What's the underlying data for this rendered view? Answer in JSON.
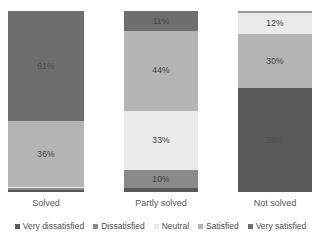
{
  "chart_data": {
    "type": "bar",
    "variant": "stacked-100-percent",
    "orientation": "vertical",
    "title": "",
    "subtitle": "",
    "xlabel": "",
    "ylabel": "",
    "ylim": [
      0,
      100
    ],
    "grid": false,
    "axis_visible": false,
    "value_labels": true,
    "value_label_suffix": "%",
    "legend_position": "bottom",
    "categories": [
      "Solved",
      "Partly solved",
      "Not solved"
    ],
    "series": [
      {
        "name": "Very dissatisfied",
        "color": "#595959",
        "values": [
          1,
          2,
          58
        ],
        "labels": [
          "",
          "",
          "58%"
        ]
      },
      {
        "name": "Dissatisfied",
        "color": "#7b7b7b",
        "values": [
          1,
          10,
          0
        ],
        "labels": [
          "",
          "10%",
          ""
        ]
      },
      {
        "name": "Neutral",
        "color": "#eaeaea",
        "values": [
          1,
          33,
          12
        ],
        "labels": [
          "",
          "33%",
          "12%"
        ]
      },
      {
        "name": "Satisfied",
        "color": "#b4b4b4",
        "values": [
          36,
          44,
          30
        ],
        "labels": [
          "36%",
          "44%",
          "30%"
        ]
      },
      {
        "name": "Very satisfied",
        "color": "#6e6e6e",
        "values": [
          61,
          11,
          0
        ],
        "labels": [
          "61%",
          "11%",
          ""
        ]
      }
    ],
    "stacks": [
      {
        "category": "Solved",
        "segments": [
          {
            "series": "Very satisfied",
            "value": 61,
            "label": "61%",
            "color": "#6e6e6e",
            "label_tone": "on-dark",
            "label_visible": true
          },
          {
            "series": "Satisfied",
            "value": 36,
            "label": "36%",
            "color": "#b4b4b4",
            "label_tone": "on-mid",
            "label_visible": true
          },
          {
            "series": "Neutral",
            "value": 1,
            "label": "",
            "color": "#eaeaea",
            "label_tone": "on-light",
            "label_visible": false
          },
          {
            "series": "Dissatisfied",
            "value": 1,
            "label": "",
            "color": "#8a8a8a",
            "label_tone": "on-mid",
            "label_visible": false
          },
          {
            "series": "Very dissatisfied",
            "value": 1,
            "label": "",
            "color": "#595959",
            "label_tone": "on-dark",
            "label_visible": false
          }
        ]
      },
      {
        "category": "Partly solved",
        "segments": [
          {
            "series": "Very satisfied",
            "value": 11,
            "label": "11%",
            "color": "#6e6e6e",
            "label_tone": "on-dark",
            "label_visible": true
          },
          {
            "series": "Satisfied",
            "value": 44,
            "label": "44%",
            "color": "#b4b4b4",
            "label_tone": "on-mid",
            "label_visible": true
          },
          {
            "series": "Neutral",
            "value": 33,
            "label": "33%",
            "color": "#eaeaea",
            "label_tone": "on-light",
            "label_visible": true
          },
          {
            "series": "Dissatisfied",
            "value": 10,
            "label": "10%",
            "color": "#8a8a8a",
            "label_tone": "on-mid",
            "label_visible": true
          },
          {
            "series": "Very dissatisfied",
            "value": 2,
            "label": "",
            "color": "#595959",
            "label_tone": "on-dark",
            "label_visible": false
          }
        ]
      },
      {
        "category": "Not solved",
        "segments": [
          {
            "series": "Satisfied-sliver",
            "value": 1,
            "label": "",
            "color": "#9a9a9a",
            "label_tone": "on-mid",
            "label_visible": false
          },
          {
            "series": "Neutral",
            "value": 12,
            "label": "12%",
            "color": "#eaeaea",
            "label_tone": "on-light",
            "label_visible": true
          },
          {
            "series": "Satisfied",
            "value": 30,
            "label": "30%",
            "color": "#b4b4b4",
            "label_tone": "on-mid",
            "label_visible": true
          },
          {
            "series": "Very dissatisfied",
            "value": 58,
            "label": "58%",
            "color": "#595959",
            "label_tone": "on-dark",
            "label_visible": true
          }
        ]
      }
    ],
    "legend": [
      {
        "label": "Very dissatisfied",
        "color": "#595959"
      },
      {
        "label": "Dissatisfied",
        "color": "#8a8a8a"
      },
      {
        "label": "Neutral",
        "color": "#eaeaea"
      },
      {
        "label": "Satisfied",
        "color": "#b4b4b4"
      },
      {
        "label": "Very satisfied",
        "color": "#6e6e6e"
      }
    ]
  }
}
